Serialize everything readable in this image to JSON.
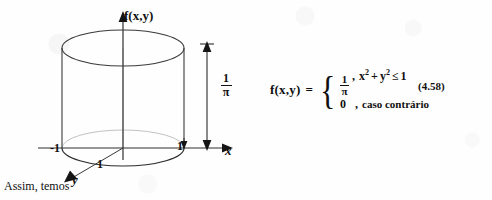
{
  "figure": {
    "vertical_axis_label": "f(x,y)",
    "x_axis_label": "x",
    "y_axis_label": "y",
    "tick_x_negative": "-1",
    "tick_x_positive": "1",
    "tick_y_positive": "1",
    "height_dimension": {
      "numerator": "1",
      "denominator": "π"
    },
    "caption": "Assim, temos",
    "shape": "cylinder",
    "colors": {
      "ink": "#101010",
      "outline": "#333333",
      "hidden_edge": "#b9b9b9",
      "background": "#fefefe"
    }
  },
  "equation": {
    "lhs": "f(x,y)",
    "equals": "=",
    "brace": "{",
    "cases": [
      {
        "value_fraction": {
          "numerator": "1",
          "denominator": "π"
        },
        "separator": ",",
        "condition_base_x": "x",
        "condition_exp_x": "2",
        "condition_plus": "+",
        "condition_base_y": "y",
        "condition_exp_y": "2",
        "condition_operator": "≤",
        "condition_value": "1"
      },
      {
        "value": "0",
        "separator": ",",
        "condition_text": "caso contrário"
      }
    ],
    "number": "(4.58)"
  }
}
